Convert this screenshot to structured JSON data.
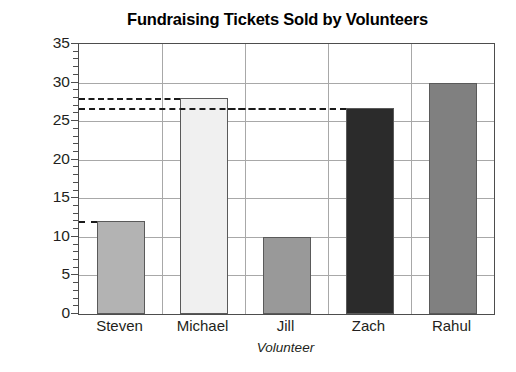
{
  "chart_data": {
    "type": "bar",
    "title": "Fundraising Tickets Sold by Volunteers",
    "xlabel": "Volunteer",
    "ylabel": "Number of Tickets",
    "categories": [
      "Steven",
      "Michael",
      "Jill",
      "Zach",
      "Rahul"
    ],
    "values": [
      12,
      28,
      10,
      26.7,
      30
    ],
    "bar_colors": [
      "#b3b3b3",
      "#f0f0f0",
      "#999999",
      "#2b2b2b",
      "#808080"
    ],
    "ylim": [
      0,
      35
    ],
    "y_ticks": [
      0,
      5,
      10,
      15,
      20,
      25,
      30,
      35
    ],
    "y_tick_labels": [
      "0",
      "5",
      "10",
      "15",
      "20",
      "25",
      "30",
      "35"
    ],
    "y_minor_step": 1,
    "grid": "both",
    "legend": "none",
    "annotations": [
      {
        "label": "dashed leader at 12 tickets",
        "value": 12,
        "extent": "axis-to-bar"
      },
      {
        "label": "dashed leader at 28 tickets",
        "value": 28,
        "extent": "axis-to-bar"
      },
      {
        "label": "dashed leader at 26.7 tickets",
        "value": 26.7,
        "extent": "axis-to-bar"
      }
    ]
  }
}
